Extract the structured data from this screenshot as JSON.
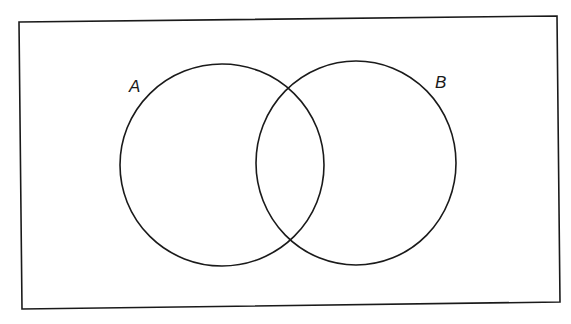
{
  "diagram": {
    "type": "venn",
    "universe": {
      "label": ""
    },
    "sets": [
      {
        "name": "A",
        "label": "A"
      },
      {
        "name": "B",
        "label": "B"
      }
    ],
    "colors": {
      "stroke": "#1a1a1a",
      "background": "#ffffff"
    }
  }
}
